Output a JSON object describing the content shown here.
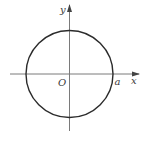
{
  "figure": {
    "type": "circle-on-axes",
    "axes": {
      "x_label": "x",
      "y_label": "y",
      "origin_label": "O"
    },
    "circle": {
      "center_label": "O",
      "radius_label": "a",
      "radius_point_label": "a"
    },
    "colors": {
      "stroke": "#2b2b2b",
      "axis": "#7a7a7a",
      "text": "#3a3a3a",
      "background": "#ffffff"
    }
  }
}
